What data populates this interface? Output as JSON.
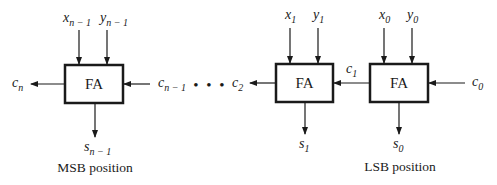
{
  "diagram": {
    "block_label": "FA",
    "blocks": [
      {
        "id": "msb",
        "label": "FA",
        "in_x": "x",
        "in_x_sub": "n − 1",
        "in_y": "y",
        "in_y_sub": "n − 1",
        "out_s": "s",
        "out_s_sub": "n − 1",
        "carry_in": "c",
        "carry_in_sub": "n − 1",
        "carry_out": "c",
        "carry_out_sub": "n",
        "caption": "MSB position"
      },
      {
        "id": "bit1",
        "label": "FA",
        "in_x": "x",
        "in_x_sub": "1",
        "in_y": "y",
        "in_y_sub": "1",
        "out_s": "s",
        "out_s_sub": "1",
        "carry_out": "c",
        "carry_out_sub": "2"
      },
      {
        "id": "lsb",
        "label": "FA",
        "in_x": "x",
        "in_x_sub": "0",
        "in_y": "y",
        "in_y_sub": "0",
        "out_s": "s",
        "out_s_sub": "0",
        "carry_in": "c",
        "carry_in_sub": "0",
        "carry_out": "c",
        "carry_out_sub": "1",
        "caption": "LSB position"
      }
    ],
    "ellipsis": "• • •",
    "colors": {
      "stroke": "#1a1a1a",
      "background": "#ffffff"
    }
  }
}
